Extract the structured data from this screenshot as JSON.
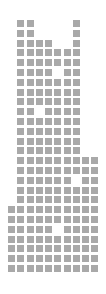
{
  "colors": {
    "cell": "#a9a9a9",
    "background": "#ffffff"
  },
  "layout": {
    "x0": 8,
    "y0": 20,
    "pitch_x": 9.25,
    "pitch_y": 9.8,
    "cell_size": 7
  },
  "chart_data": {
    "type": "waffle",
    "title": "",
    "xlabel": "",
    "ylabel": "",
    "grid": false,
    "columns": 10,
    "rows_count": 26,
    "rows": [
      [
        1,
        2,
        7
      ],
      [
        1,
        2,
        7
      ],
      [
        1,
        2,
        3,
        4,
        7
      ],
      [
        1,
        2,
        3,
        4,
        5,
        6,
        7
      ],
      [
        1,
        2,
        3,
        4,
        5,
        6,
        7
      ],
      [
        1,
        2,
        3,
        4,
        6,
        7
      ],
      [
        1,
        2,
        3,
        4,
        5,
        6,
        7
      ],
      [
        1,
        2,
        3,
        4,
        5,
        6,
        7
      ],
      [
        1,
        2,
        3,
        4,
        5,
        6,
        7
      ],
      [
        1,
        2,
        4,
        5,
        6,
        7
      ],
      [
        1,
        2,
        3,
        4,
        5,
        6,
        7
      ],
      [
        1,
        2,
        3,
        4,
        5,
        6,
        7
      ],
      [
        1,
        2,
        3,
        4,
        5,
        6,
        7
      ],
      [
        1,
        2,
        3,
        4,
        5,
        6,
        7
      ],
      [
        1,
        2,
        3,
        4,
        5,
        6,
        7,
        8,
        9
      ],
      [
        1,
        2,
        3,
        4,
        5,
        6,
        7,
        8,
        9
      ],
      [
        1,
        2,
        3,
        4,
        5,
        6,
        8,
        9
      ],
      [
        1,
        2,
        3,
        4,
        5,
        6,
        7,
        8,
        9
      ],
      [
        1,
        2,
        3,
        4,
        5,
        6,
        7,
        8,
        9
      ],
      [
        0,
        1,
        2,
        3,
        4,
        5,
        6,
        7,
        8,
        9
      ],
      [
        0,
        1,
        2,
        3,
        4,
        5,
        6,
        7,
        8,
        9
      ],
      [
        0,
        1,
        2,
        3,
        4,
        6,
        7,
        8,
        9
      ],
      [
        0,
        1,
        2,
        3,
        4,
        5,
        6,
        7,
        8,
        9
      ],
      [
        0,
        1,
        2,
        3,
        4,
        5,
        6,
        7,
        8,
        9
      ],
      [
        0,
        1,
        2,
        3,
        4,
        5,
        6,
        7,
        8,
        9
      ],
      [
        0,
        1,
        2,
        3,
        4,
        5,
        6,
        7,
        8,
        9
      ]
    ]
  }
}
